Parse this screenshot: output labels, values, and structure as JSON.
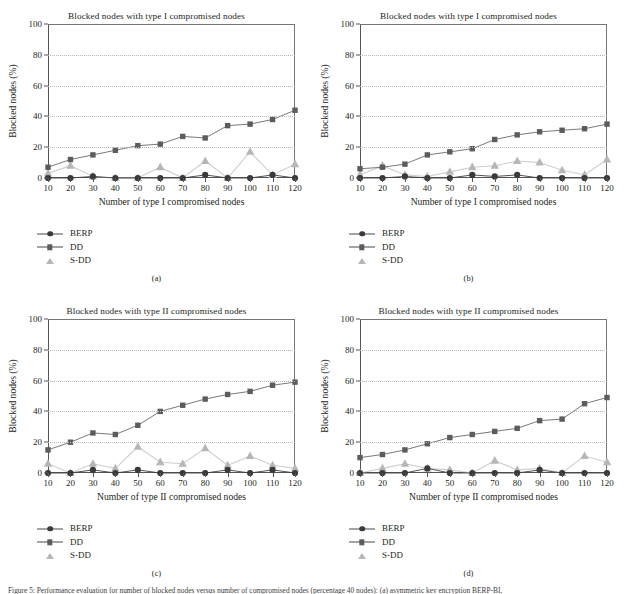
{
  "figure": {
    "caption": "Figure 5: Performance evaluation for number of blocked nodes versus number of compromised nodes (percentage 40 nodes): (a) asymmetric key encryption BERP-BI,"
  },
  "axis": {
    "y_ticks": [
      0,
      20,
      40,
      60,
      80,
      100
    ],
    "x_ticks": [
      10,
      20,
      30,
      40,
      50,
      60,
      70,
      80,
      90,
      100,
      110,
      120
    ],
    "ylim": [
      0,
      100
    ],
    "ylabel": "Blocked nodes (%)"
  },
  "legend": {
    "entries": [
      {
        "label": "BERP",
        "marker": "circle-icon",
        "color": "#3a3a3a"
      },
      {
        "label": "DD",
        "marker": "square-icon",
        "color": "#5c5c5c"
      },
      {
        "label": "S-DD",
        "marker": "triangle-icon",
        "color": "#b6b6b6"
      }
    ]
  },
  "panels": [
    {
      "key": "a",
      "sublabel": "(a)",
      "title": "Blocked nodes with type I compromised nodes",
      "xlabel": "Number of type I compromised nodes"
    },
    {
      "key": "b",
      "sublabel": "(b)",
      "title": "Blocked nodes with type I compromised nodes",
      "xlabel": "Number of type I compromised nodes"
    },
    {
      "key": "c",
      "sublabel": "(c)",
      "title": "Blocked nodes with type II compromised nodes",
      "xlabel": "Number of type II compromised nodes"
    },
    {
      "key": "d",
      "sublabel": "(d)",
      "title": "Blocked nodes with type II compromised nodes",
      "xlabel": "Number of type II compromised nodes"
    }
  ],
  "chart_data": [
    {
      "panel": "a",
      "type": "line",
      "title": "Blocked nodes with type I compromised nodes",
      "xlabel": "Number of type I compromised nodes",
      "ylabel": "Blocked nodes (%)",
      "x": [
        10,
        20,
        30,
        40,
        50,
        60,
        70,
        80,
        90,
        100,
        110,
        120
      ],
      "ylim": [
        0,
        100
      ],
      "xlim": [
        10,
        120
      ],
      "grid": true,
      "legend_position": "below-left",
      "series": [
        {
          "name": "BERP",
          "values": [
            0,
            0,
            1,
            0,
            0,
            0,
            0,
            2,
            0,
            0,
            2,
            0
          ]
        },
        {
          "name": "DD",
          "values": [
            7,
            12,
            15,
            18,
            21,
            22,
            27,
            26,
            34,
            35,
            38,
            44
          ]
        },
        {
          "name": "S-DD",
          "values": [
            3,
            8,
            1,
            0,
            0,
            7,
            0,
            11,
            0,
            17,
            2,
            9
          ]
        }
      ]
    },
    {
      "panel": "b",
      "type": "line",
      "title": "Blocked nodes with type I compromised nodes",
      "xlabel": "Number of type I compromised nodes",
      "ylabel": "Blocked nodes (%)",
      "x": [
        10,
        20,
        30,
        40,
        50,
        60,
        70,
        80,
        90,
        100,
        110,
        120
      ],
      "ylim": [
        0,
        100
      ],
      "xlim": [
        10,
        120
      ],
      "grid": true,
      "legend_position": "below-left",
      "series": [
        {
          "name": "BERP",
          "values": [
            0,
            0,
            1,
            0,
            0,
            2,
            1,
            2,
            0,
            0,
            0,
            0
          ]
        },
        {
          "name": "DD",
          "values": [
            6,
            7,
            9,
            15,
            17,
            19,
            25,
            28,
            30,
            31,
            32,
            35
          ]
        },
        {
          "name": "S-DD",
          "values": [
            2,
            8,
            2,
            1,
            4,
            7,
            8,
            11,
            10,
            5,
            2,
            12
          ]
        }
      ]
    },
    {
      "panel": "c",
      "type": "line",
      "title": "Blocked nodes with type II compromised nodes",
      "xlabel": "Number of type II compromised nodes",
      "ylabel": "Blocked nodes (%)",
      "x": [
        10,
        20,
        30,
        40,
        50,
        60,
        70,
        80,
        90,
        100,
        110,
        120
      ],
      "ylim": [
        0,
        100
      ],
      "xlim": [
        10,
        120
      ],
      "grid": true,
      "legend_position": "below-left",
      "series": [
        {
          "name": "BERP",
          "values": [
            0,
            0,
            2,
            0,
            2,
            0,
            0,
            0,
            2,
            0,
            2,
            0
          ]
        },
        {
          "name": "DD",
          "values": [
            15,
            20,
            26,
            25,
            31,
            40,
            44,
            48,
            51,
            53,
            57,
            59
          ]
        },
        {
          "name": "S-DD",
          "values": [
            6,
            0,
            6,
            3,
            17,
            7,
            6,
            16,
            5,
            11,
            5,
            3
          ]
        }
      ]
    },
    {
      "panel": "d",
      "type": "line",
      "title": "Blocked nodes with type II compromised nodes",
      "xlabel": "Number of type II compromised nodes",
      "ylabel": "Blocked nodes (%)",
      "x": [
        10,
        20,
        30,
        40,
        50,
        60,
        70,
        80,
        90,
        100,
        110,
        120
      ],
      "ylim": [
        0,
        100
      ],
      "xlim": [
        10,
        120
      ],
      "grid": true,
      "legend_position": "below-left",
      "series": [
        {
          "name": "BERP",
          "values": [
            0,
            0,
            0,
            3,
            0,
            0,
            0,
            0,
            2,
            0,
            0,
            0
          ]
        },
        {
          "name": "DD",
          "values": [
            10,
            12,
            15,
            19,
            23,
            25,
            27,
            29,
            34,
            35,
            45,
            49
          ]
        },
        {
          "name": "S-DD",
          "values": [
            0,
            3,
            6,
            3,
            2,
            0,
            8,
            2,
            3,
            0,
            11,
            7
          ]
        }
      ]
    }
  ]
}
